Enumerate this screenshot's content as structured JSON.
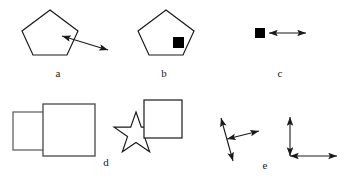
{
  "figure": {
    "background_color": "#ffffff",
    "stroke_color": "#1a1a1a",
    "fill_color": "#000000",
    "width": 353,
    "height": 184,
    "panel_labels": [
      {
        "id": "a",
        "text": "a",
        "x": 58,
        "y": 73
      },
      {
        "id": "b",
        "text": "b",
        "x": 164,
        "y": 73
      },
      {
        "id": "c",
        "text": "c",
        "x": 280,
        "y": 73
      },
      {
        "id": "d",
        "text": "d",
        "x": 106,
        "y": 162
      },
      {
        "id": "e",
        "text": "e",
        "x": 265,
        "y": 165
      }
    ],
    "panels": [
      {
        "id": "a",
        "label": "a",
        "description": "Pentagon outline with a double-headed arrow touching its lower-right edge and extending down to the right",
        "elements": [
          {
            "kind": "pentagon",
            "name": "pentagon-outline",
            "points": "50,10 78,31 67,55 33,55 22,31",
            "filled": false
          },
          {
            "kind": "double-arrow",
            "name": "double-arrow",
            "x1": 62,
            "y1": 36,
            "x2": 108,
            "y2": 50
          }
        ]
      },
      {
        "id": "b",
        "label": "b",
        "description": "Pentagon outline with a small solid black square centered on its right vertex",
        "elements": [
          {
            "kind": "pentagon",
            "name": "pentagon-outline",
            "points": "166,10 194,31 183,55 149,55 138,31"
          },
          {
            "kind": "square",
            "name": "black-square-marker",
            "x": 173,
            "y": 37,
            "size": 11,
            "filled": true
          }
        ]
      },
      {
        "id": "c",
        "label": "c",
        "description": "Small solid black square with a horizontal double-headed arrow to its right",
        "elements": [
          {
            "kind": "square",
            "name": "black-square-marker",
            "x": 255,
            "y": 28,
            "size": 10,
            "filled": true
          },
          {
            "kind": "double-arrow",
            "name": "horizontal-double-arrow",
            "x1": 268,
            "y1": 33,
            "x2": 306,
            "y2": 33
          }
        ]
      },
      {
        "id": "d",
        "label": "d",
        "description": "Left: a small square partly occluded by a larger square. Right: a five-pointed star whose upper point is occluded by a square.",
        "elements": [
          {
            "kind": "square",
            "name": "small-square-left",
            "x": 13,
            "y": 112,
            "width": 38,
            "height": 38
          },
          {
            "kind": "square",
            "name": "large-square-left",
            "x": 43,
            "y": 104,
            "width": 52,
            "height": 52
          },
          {
            "kind": "star",
            "name": "star-outline",
            "cx": 136,
            "cy": 134,
            "r_outer": 22,
            "r_inner": 9
          },
          {
            "kind": "square",
            "name": "square-over-star",
            "x": 144,
            "y": 100,
            "width": 38,
            "height": 38
          }
        ]
      },
      {
        "id": "e",
        "label": "e",
        "description": "Left: a tilted double-headed arrow with a branching double-headed arrow to the upper right. Right: an L-shaped pair of double-headed arrows meeting at a corner.",
        "elements": [
          {
            "kind": "double-arrow",
            "name": "tilted-main-arrow",
            "x1": 221,
            "y1": 118,
            "x2": 233,
            "y2": 161
          },
          {
            "kind": "double-arrow",
            "name": "branch-arrow",
            "x1": 227,
            "y1": 139,
            "x2": 259,
            "y2": 131
          },
          {
            "kind": "double-arrow",
            "name": "vertical-axis-arrow",
            "x1": 290,
            "y1": 117,
            "x2": 290,
            "y2": 156
          },
          {
            "kind": "double-arrow",
            "name": "horizontal-axis-arrow",
            "x1": 290,
            "y1": 156,
            "x2": 337,
            "y2": 156
          }
        ]
      }
    ]
  }
}
